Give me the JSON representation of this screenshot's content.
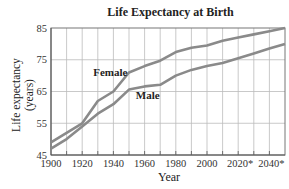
{
  "chart_data": {
    "type": "line",
    "title": "Life Expectancy at Birth",
    "xlabel": "Year",
    "ylabel": "Life expectancy (years)",
    "ylabel_lines": [
      "Life expectancy",
      "(years)"
    ],
    "x": [
      1900,
      1910,
      1920,
      1930,
      1940,
      1950,
      1960,
      1970,
      1980,
      1990,
      2000,
      2010,
      2020,
      2030,
      2040,
      2050
    ],
    "xlim": [
      1900,
      2050
    ],
    "ylim": [
      45,
      85
    ],
    "x_ticks": [
      "1900",
      "1920",
      "1940",
      "1960",
      "1980",
      "2000",
      "2020*",
      "2040*"
    ],
    "x_tick_values": [
      1900,
      1920,
      1940,
      1960,
      1980,
      2000,
      2020,
      2040
    ],
    "y_ticks": [
      45,
      55,
      65,
      75,
      85
    ],
    "grid": true,
    "series": [
      {
        "name": "Female",
        "values": [
          49,
          52,
          55,
          62,
          65,
          71,
          73,
          74.7,
          77.4,
          78.8,
          79.5,
          81,
          82,
          83,
          84,
          85
        ]
      },
      {
        "name": "Male",
        "values": [
          47,
          50,
          54,
          58,
          61,
          65.6,
          66.6,
          67.1,
          70,
          71.8,
          73,
          74,
          75.5,
          77,
          78.5,
          80
        ]
      }
    ],
    "annotations": [
      {
        "text": "Female",
        "x": 1938,
        "y": 70
      },
      {
        "text": "Male",
        "x": 1962,
        "y": 62.5
      }
    ],
    "line_color": "#8a8a8a",
    "grid_color": "#bbbbbb"
  }
}
